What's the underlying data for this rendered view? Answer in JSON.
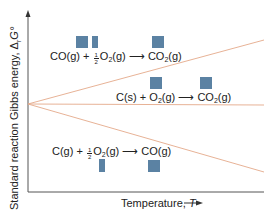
{
  "diagram": {
    "type": "ellingham-diagram",
    "axes": {
      "x_label": "Temperature,",
      "x_symbol": "T",
      "y_label": "Standard reaction Gibbs energy,",
      "y_symbol": "Δ",
      "y_symbol_sub": "r",
      "y_symbol_main": "G°"
    },
    "colors": {
      "axis": "#555555",
      "lines": "#e4a98a",
      "squares": "#5b82a3",
      "text": "#222222"
    },
    "reactions": [
      {
        "id": "co-to-co2",
        "reactant1": "CO(g)",
        "plus": "+",
        "coef_num": "1",
        "coef_den": "2",
        "reactant2_main": "O",
        "reactant2_sub": "2",
        "reactant2_tail": "(g)",
        "arrow": "⟶",
        "product_main": "CO",
        "product_sub": "2",
        "product_tail": "(g)",
        "slope": "positive"
      },
      {
        "id": "c-to-co2",
        "reactant1": "C(s)",
        "plus": "+",
        "reactant2_main": "O",
        "reactant2_sub": "2",
        "reactant2_tail": "(g)",
        "arrow": "⟶",
        "product_main": "CO",
        "product_sub": "2",
        "product_tail": "(g)",
        "slope": "flat"
      },
      {
        "id": "c-to-co",
        "reactant1": "C(g)",
        "plus": "+",
        "coef_num": "1",
        "coef_den": "2",
        "reactant2_main": "O",
        "reactant2_sub": "2",
        "reactant2_tail": "(g)",
        "arrow": "⟶",
        "product": "CO(g)",
        "slope": "negative"
      }
    ]
  }
}
